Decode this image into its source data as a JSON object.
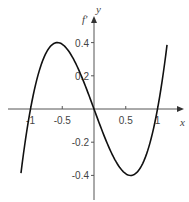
{
  "chart_data": {
    "type": "line",
    "title": "",
    "xlabel": "x",
    "ylabel": "y",
    "function_label": "f'",
    "x_ticks": [
      -1,
      -0.5,
      0.5,
      1
    ],
    "x_tick_labels": [
      "-1",
      "-0.5",
      "0.5",
      "1"
    ],
    "y_ticks": [
      0.4,
      0.2,
      -0.2,
      -0.4
    ],
    "y_tick_labels": [
      "0.4",
      "0.2",
      "-0.2",
      "-0.4"
    ],
    "xlim": [
      -1.3,
      1.4
    ],
    "ylim": [
      -0.55,
      0.55
    ],
    "grid": false,
    "series": [
      {
        "name": "f'",
        "x": [
          -1.15,
          -1.0,
          -0.8,
          -0.577,
          -0.4,
          -0.2,
          0,
          0.2,
          0.4,
          0.577,
          0.8,
          1.0,
          1.15
        ],
        "y": [
          -0.5,
          0,
          0.3,
          0.4,
          0.35,
          0.2,
          0,
          -0.2,
          -0.35,
          -0.4,
          -0.3,
          0,
          0.5
        ]
      }
    ]
  }
}
